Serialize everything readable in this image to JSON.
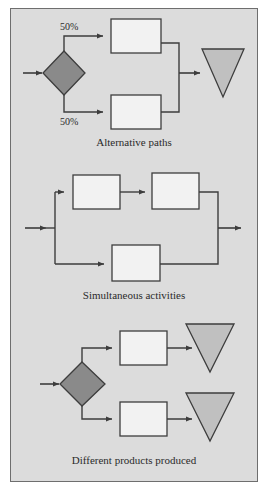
{
  "figure": {
    "background_color": "#dcdcdc",
    "frame_border_color": "#6e6e6e",
    "page_background": "#ffffff"
  },
  "colors": {
    "decision_fill": "#8a8a8a",
    "output_fill": "#c0c0c0",
    "activity_fill": "#f2f2f2",
    "stroke": "#3d3d3d",
    "text": "#2b2b2b"
  },
  "panels": [
    {
      "id": "alternative-paths",
      "caption": "Alternative paths",
      "nodes": [
        {
          "name": "decision-diamond",
          "shape": "diamond",
          "fill": "#8a8a8a"
        },
        {
          "name": "activity-box-top",
          "shape": "rect",
          "fill": "#f2f2f2"
        },
        {
          "name": "activity-box-bottom",
          "shape": "rect",
          "fill": "#f2f2f2"
        },
        {
          "name": "output-triangle",
          "shape": "triangle-down",
          "fill": "#c0c0c0"
        }
      ],
      "branch_labels": [
        "50%",
        "50%"
      ]
    },
    {
      "id": "simultaneous-activities",
      "caption": "Simultaneous activities",
      "nodes": [
        {
          "name": "activity-box-top-left",
          "shape": "rect",
          "fill": "#f2f2f2"
        },
        {
          "name": "activity-box-top-right",
          "shape": "rect",
          "fill": "#f2f2f2"
        },
        {
          "name": "activity-box-bottom",
          "shape": "rect",
          "fill": "#f2f2f2"
        }
      ],
      "branch_labels": []
    },
    {
      "id": "different-products-produced",
      "caption": "Different products produced",
      "nodes": [
        {
          "name": "decision-diamond",
          "shape": "diamond",
          "fill": "#8a8a8a"
        },
        {
          "name": "activity-box-top",
          "shape": "rect",
          "fill": "#f2f2f2"
        },
        {
          "name": "activity-box-bottom",
          "shape": "rect",
          "fill": "#f2f2f2"
        },
        {
          "name": "output-triangle-top",
          "shape": "triangle-down",
          "fill": "#c0c0c0"
        },
        {
          "name": "output-triangle-bottom",
          "shape": "triangle-down",
          "fill": "#c0c0c0"
        }
      ],
      "branch_labels": []
    }
  ],
  "labels": {
    "panel1_caption": "Alternative paths",
    "panel1_pct_top": "50%",
    "panel1_pct_bottom": "50%",
    "panel2_caption": "Simultaneous activities",
    "panel3_caption": "Different products produced"
  }
}
